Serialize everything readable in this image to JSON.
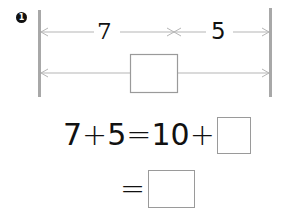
{
  "problem": {
    "number_badge": "1",
    "diagram": {
      "top_segments": [
        {
          "label": "7"
        },
        {
          "label": "5"
        }
      ],
      "bottom_segment": {
        "blank": ""
      },
      "colors": {
        "bar": "#a8a8a8",
        "line": "#b5b5b5",
        "box_border": "#9a9a9a"
      }
    },
    "equation_line_1": {
      "tokens": [
        "7",
        "+",
        "5",
        "=",
        "10",
        "+"
      ],
      "blank": ""
    },
    "equation_line_2": {
      "tokens": [
        "="
      ],
      "blank": ""
    }
  }
}
